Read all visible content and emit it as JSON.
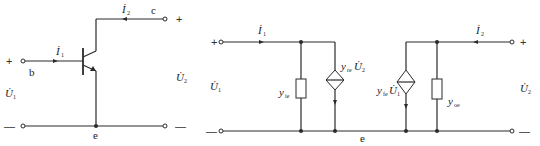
{
  "figure": {
    "colors": {
      "line": "#2a2a2a",
      "text": "#222222",
      "background": "#ffffff"
    }
  },
  "left_circuit": {
    "title": "BJT common-emitter two-port",
    "terminals": {
      "base": "b",
      "collector": "c",
      "emitter": "e"
    },
    "input_current": {
      "symbol": "İ",
      "sub": "1"
    },
    "output_current": {
      "symbol": "İ",
      "sub": "2"
    },
    "input_voltage": {
      "symbol": "U̇",
      "sub": "1"
    },
    "output_voltage": {
      "symbol": "U̇",
      "sub": "2"
    },
    "signs": {
      "in_plus": "+",
      "in_minus": "—",
      "out_plus": "+",
      "out_minus": "—"
    }
  },
  "right_circuit": {
    "title": "Y-parameter equivalent circuit",
    "input_current": {
      "symbol": "İ",
      "sub": "1"
    },
    "output_current": {
      "symbol": "İ",
      "sub": "2"
    },
    "input_voltage": {
      "symbol": "U̇",
      "sub": "1"
    },
    "output_voltage": {
      "symbol": "U̇",
      "sub": "2"
    },
    "common_node": "e",
    "elements": [
      {
        "type": "admittance",
        "label": "y",
        "sub": "ie"
      },
      {
        "type": "dependent-current-source",
        "label": "y",
        "sub": "re",
        "control": "U̇",
        "control_sub": "2"
      },
      {
        "type": "dependent-current-source",
        "label": "y",
        "sub": "fe",
        "control": "U̇",
        "control_sub": "1"
      },
      {
        "type": "admittance",
        "label": "y",
        "sub": "oe"
      }
    ],
    "signs": {
      "in_plus": "+",
      "in_minus": "—",
      "out_plus": "+",
      "out_minus": "—"
    }
  }
}
